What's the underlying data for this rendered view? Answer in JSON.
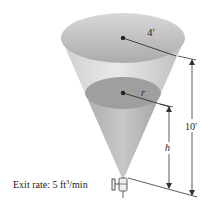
{
  "figure": {
    "labels": {
      "top_radius": "4′",
      "water_radius": "r",
      "total_height": "10′",
      "water_height": "h",
      "exit_rate_prefix": "Exit rate: 5 ft",
      "exit_rate_exponent": "3",
      "exit_rate_suffix": "/min"
    },
    "colors": {
      "cone_light": "#e6e6e6",
      "cone_dark": "#a9a9a9",
      "top_surface": "#bdbdbd",
      "water_surface": "#9d9d9d",
      "line": "#333333"
    }
  }
}
